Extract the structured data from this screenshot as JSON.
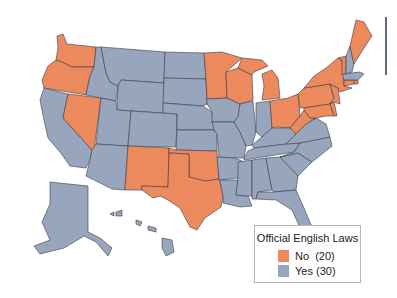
{
  "chart_data": {
    "type": "choropleth",
    "title": "Official English Laws",
    "legend": {
      "title": "Official English Laws",
      "placement": "bottom-right",
      "entries": [
        {
          "key": "no",
          "label": "No  (20)",
          "color": "#ec8a5e",
          "count": 20
        },
        {
          "key": "yes",
          "label": "Yes (30)",
          "color": "#98a6bd",
          "count": 30
        }
      ]
    },
    "states": {
      "WA": "no",
      "OR": "no",
      "NV": "no",
      "NM": "no",
      "TX": "no",
      "OK": "no",
      "MN": "no",
      "WI": "no",
      "MI": "no",
      "OH": "no",
      "PA": "no",
      "NY": "no",
      "VT": "no",
      "ME": "no",
      "CT": "no",
      "RI": "no",
      "NJ": "no",
      "DE": "no",
      "MD": "no",
      "WV": "no",
      "CA": "yes",
      "ID": "yes",
      "MT": "yes",
      "WY": "yes",
      "UT": "yes",
      "CO": "yes",
      "AZ": "yes",
      "ND": "yes",
      "SD": "yes",
      "NE": "yes",
      "KS": "yes",
      "IA": "yes",
      "MO": "yes",
      "AR": "yes",
      "LA": "yes",
      "IL": "yes",
      "IN": "yes",
      "KY": "yes",
      "TN": "yes",
      "MS": "yes",
      "AL": "yes",
      "GA": "yes",
      "FL": "yes",
      "SC": "yes",
      "NC": "yes",
      "VA": "yes",
      "NH": "yes",
      "MA": "yes",
      "AK": "yes",
      "HI": "yes"
    }
  }
}
